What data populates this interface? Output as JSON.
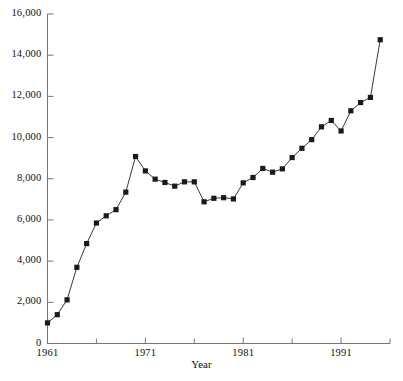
{
  "chart_data": {
    "type": "line",
    "title": "",
    "subtitle": "",
    "xlabel": "Year",
    "ylabel": "",
    "xlim": [
      1961,
      1996
    ],
    "ylim": [
      0,
      16000
    ],
    "grid": false,
    "legend": null,
    "marker": "filled-square",
    "line_color": "#3a3a3a",
    "marker_color": "#1a1a1a",
    "xticks": [
      1961,
      1971,
      1981,
      1991
    ],
    "xtick_labels": [
      "1961",
      "1971",
      "1981",
      "1991"
    ],
    "xminor_ticks": [
      1966,
      1976,
      1986,
      1996
    ],
    "yticks": [
      0,
      2000,
      4000,
      6000,
      8000,
      10000,
      12000,
      14000,
      16000
    ],
    "ytick_labels": [
      "0",
      "2,000",
      "4,000",
      "6,000",
      "8,000",
      "10,000",
      "12,000",
      "14,000",
      "16,000"
    ],
    "x": [
      1961,
      1962,
      1963,
      1964,
      1965,
      1966,
      1967,
      1968,
      1969,
      1970,
      1971,
      1972,
      1973,
      1974,
      1975,
      1976,
      1977,
      1978,
      1979,
      1980,
      1981,
      1982,
      1983,
      1984,
      1985,
      1986,
      1987,
      1988,
      1989,
      1990,
      1991,
      1992,
      1993,
      1994,
      1995
    ],
    "values": [
      1000,
      1400,
      2120,
      3700,
      4850,
      5850,
      6200,
      6500,
      7350,
      9080,
      8380,
      7980,
      7820,
      7640,
      7850,
      7850,
      6880,
      7050,
      7080,
      7020,
      7800,
      8060,
      8500,
      8320,
      8480,
      9030,
      9480,
      9900,
      10520,
      10830,
      10320,
      11300,
      11700,
      11950,
      14750
    ],
    "series": [
      {
        "name": "",
        "values": [
          1000,
          1400,
          2120,
          3700,
          4850,
          5850,
          6200,
          6500,
          7350,
          9080,
          8380,
          7980,
          7820,
          7640,
          7850,
          7850,
          6880,
          7050,
          7080,
          7020,
          7800,
          8060,
          8500,
          8320,
          8480,
          9030,
          9480,
          9900,
          10520,
          10830,
          10320,
          11300,
          11700,
          11950,
          14750
        ]
      }
    ]
  },
  "axis": {
    "x_title": "Year"
  }
}
